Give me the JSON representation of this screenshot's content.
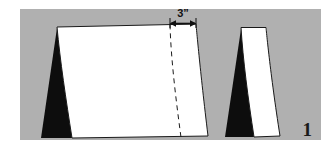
{
  "figure": {
    "number_label": "1",
    "dimension_label": "3”",
    "background_color": "#ffffff",
    "panel_color": "#b0b0b0",
    "sheet_color": "#ffffff",
    "shadow_color": "#0d0d0d",
    "outline_color": "#1a1a1a",
    "dimension_text_color": "#111111",
    "panel": {
      "x": 20,
      "y": 9,
      "width": 301,
      "height": 131
    },
    "annotations": {
      "arrow_label": "3”",
      "arrow_start_x": 170,
      "arrow_end_x": 196,
      "arrow_y": 24,
      "fold_line_style": "dashed"
    },
    "shapes": [
      {
        "name": "large-draped-sheet",
        "type": "draped-panel",
        "has_shadow_wedge": true,
        "has_fold_line": true
      },
      {
        "name": "small-draped-sheet",
        "type": "draped-panel",
        "has_shadow_wedge": true,
        "has_fold_line": false
      }
    ]
  }
}
